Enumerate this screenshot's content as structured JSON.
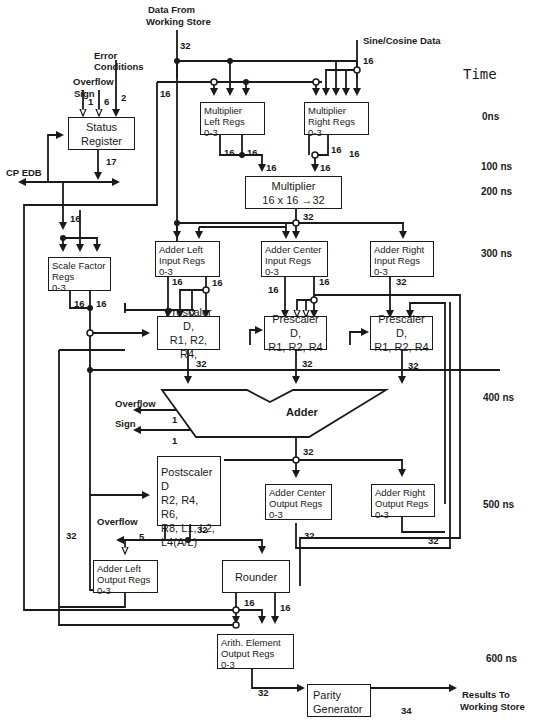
{
  "diagram": {
    "type": "hardware block diagram - arithmetic element pipeline",
    "inputs": {
      "data_from_ws_line1": "Data From",
      "data_from_ws_line2": "Working Store",
      "sine_cosine": "Sine/Cosine Data",
      "error_line1": "Error",
      "error_line2": "Conditions",
      "overflow": "Overflow",
      "sign": "Sign",
      "cp_edb": "CP EDB"
    },
    "outputs": {
      "results_line1": "Results To",
      "results_line2": "Working Store",
      "adder_overflow": "Overflow",
      "adder_sign": "Sign",
      "post_overflow": "Overflow"
    },
    "blocks": {
      "status_register": [
        "Status",
        "Register"
      ],
      "mult_left": [
        "Multiplier",
        "Left Regs",
        "0-3"
      ],
      "mult_right": [
        "Multiplier",
        "Right Regs",
        "0-3"
      ],
      "multiplier": [
        "Multiplier",
        "16 x 16 →32"
      ],
      "scale_factor": [
        "Scale Factor",
        "Regs",
        "0-3"
      ],
      "adder_left_in": [
        "Adder Left",
        "Input Regs",
        "0-3"
      ],
      "adder_center_in": [
        "Adder Center",
        "Input Regs",
        "0-3"
      ],
      "adder_right_in": [
        "Adder Right",
        "Input Regs",
        "0-3"
      ],
      "prescaler_left": [
        "Prescaler D,",
        "R1, R2, R4,"
      ],
      "prescaler_center": [
        "Prescaler D,",
        "R1, R2, R4"
      ],
      "prescaler_right": [
        "Prescaler D,",
        "R1, R2, R4"
      ],
      "adder": "Adder",
      "postscaler": [
        "Postscaler D",
        "R2, R4, R6,",
        "R8, L1, L2,",
        "L4(A/L)"
      ],
      "adder_center_out": [
        "Adder Center",
        "Output Regs",
        "0-3"
      ],
      "adder_right_out": [
        "Adder Right",
        "Output Regs",
        "0-3"
      ],
      "adder_left_out": [
        "Adder Left",
        "Output Regs",
        "0-3"
      ],
      "rounder": "Rounder",
      "arith_out": [
        "Arith. Element",
        "Output Regs",
        "0-3"
      ],
      "parity": [
        "Parity",
        "Generator"
      ]
    },
    "bus_widths": {
      "ws_in": "32",
      "sincos": "16",
      "feedback16": "16",
      "err1": "1",
      "err6": "6",
      "err2": "2",
      "status_out": "17",
      "ml_a": "16",
      "ml_b": "16",
      "ml_c": "16",
      "mr_a": "16",
      "mr_b": "16",
      "mr_c": "16",
      "mult_out": "32",
      "sf_in": "16",
      "sf_a": "16",
      "sf_b": "16",
      "al_a": "16",
      "al_b": "16",
      "ac_a": "16",
      "ac_b": "16",
      "ar_a": "32",
      "pl_out": "32",
      "pc_out": "32",
      "pr_out": "32",
      "ovf": "1",
      "sgn": "1",
      "adder_out": "32",
      "post_ovf": "5",
      "post_out": "32",
      "aco_out": "32",
      "aro_out": "32",
      "left_loop": "32",
      "rnd_a": "16",
      "rnd_b": "16",
      "aeo_out": "32",
      "parity_out": "34"
    },
    "time_axis": {
      "title": "Time",
      "labels": [
        "0ns",
        "100 ns",
        "200 ns",
        "300 ns",
        "400 ns",
        "500 ns",
        "600 ns"
      ]
    }
  }
}
